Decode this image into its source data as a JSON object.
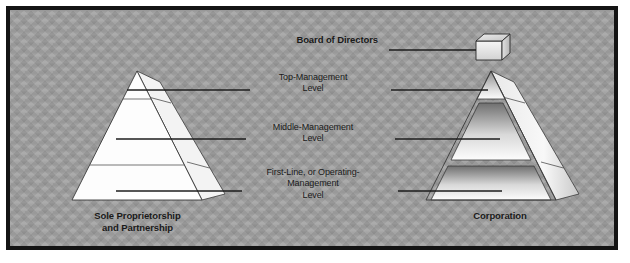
{
  "figure": {
    "background_color": "#9e9e9e",
    "frame_color": "#141414"
  },
  "labels": {
    "board_of_directors": "Board of Directors",
    "top_management": "Top-Management\nLevel",
    "middle_management": "Middle-Management\nLevel",
    "first_line": "First-Line, or Operating-\nManagement\nLevel",
    "left_caption": "Sole Proprietorship\nand Partnership",
    "right_caption": "Corporation"
  },
  "label_lines": {
    "board_of_directors": [
      "Board of Directors"
    ],
    "top_management": [
      "Top-Management",
      "Level"
    ],
    "middle_management": [
      "Middle-Management",
      "Level"
    ],
    "first_line": [
      "First-Line, or Operating-",
      "Management",
      "Level"
    ],
    "left_caption": [
      "Sole Proprietorship",
      "and Partnership"
    ],
    "right_caption": [
      "Corporation"
    ]
  },
  "diagram": {
    "left_pyramid": {
      "name": "Sole Proprietorship and Partnership",
      "fill_style": "white",
      "bands": [
        "Top-Management Level",
        "Middle-Management Level",
        "First-Line, or Operating-Management Level"
      ],
      "has_board_of_directors_box": false
    },
    "right_pyramid": {
      "name": "Corporation",
      "fill_style": "gradient",
      "bands": [
        "Top-Management Level",
        "Middle-Management Level",
        "First-Line, or Operating-Management Level"
      ],
      "has_board_of_directors_box": true
    },
    "board_box": {
      "icon": "cube-icon",
      "label": "Board of Directors"
    }
  }
}
